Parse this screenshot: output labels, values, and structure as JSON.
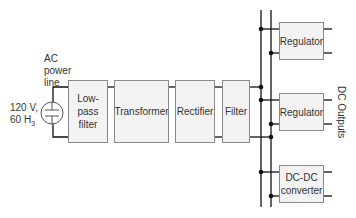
{
  "diagram": {
    "type": "block-diagram",
    "title": "",
    "source": {
      "label_lines": [
        "AC",
        "power",
        "line"
      ],
      "rating_line1": "120 V,",
      "rating_line2_main": "60 H",
      "rating_line2_sub": "3",
      "icon": "ac-source-icon"
    },
    "blocks": [
      {
        "id": "lowpass",
        "lines": [
          "Low-",
          "pass",
          "filter"
        ]
      },
      {
        "id": "transformer",
        "lines": [
          "Transformer"
        ]
      },
      {
        "id": "rectifier",
        "lines": [
          "Rectifier"
        ]
      },
      {
        "id": "filter",
        "lines": [
          "Filter"
        ]
      }
    ],
    "outputs": [
      {
        "id": "regulator1",
        "lines": [
          "Regulator"
        ]
      },
      {
        "id": "regulator2",
        "lines": [
          "Regulator"
        ]
      },
      {
        "id": "dcdc",
        "lines": [
          "DC-DC",
          "converter"
        ]
      }
    ],
    "output_label": "DC Outputs",
    "colors": {
      "line": "#111111",
      "box_border": "#8a8a8a",
      "box_fill": "#f3f3f3",
      "text": "#333333"
    }
  }
}
